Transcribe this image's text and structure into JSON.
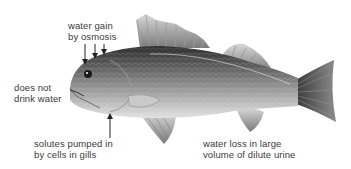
{
  "diagram": {
    "labels": {
      "water_gain": {
        "line1": "water gain",
        "line2": "by osmosis"
      },
      "no_drink": {
        "line1": "does not",
        "line2": "drink water"
      },
      "solutes": {
        "line1": "solutes pumped in",
        "line2": "by cells in gills"
      },
      "water_loss": {
        "line1": "water loss in large",
        "line2": "volume of dilute urine"
      }
    },
    "colors": {
      "text": "#3a3a3a",
      "fish_dark": "#3c3c3c",
      "fish_mid": "#8a8a8a",
      "fish_light": "#d4d4d4",
      "arrow": "#222222"
    }
  }
}
